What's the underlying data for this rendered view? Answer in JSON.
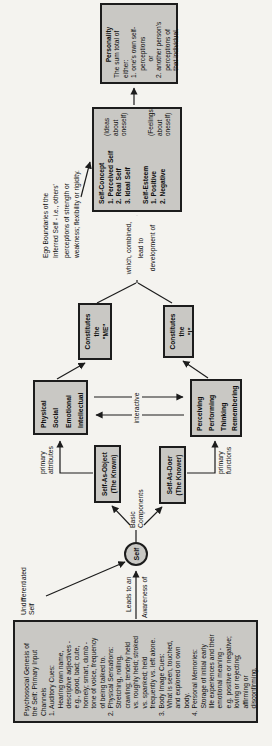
{
  "palette": {
    "page_bg": "#f4f3ef",
    "box_fill": "#c9c8c4",
    "line_color": "#1c1c1c"
  },
  "info_box": {
    "lines": [
      "Psychosocial Genesis of",
      "the Self: Primary Input",
      "Channels",
      "1. Auditory Cues:",
      "    Hearing own name,",
      "    descriptive adjectives -",
      "    e.g., good, bad; cute,",
      "    homely; smart, dumb -",
      "    tone of voice, frequency",
      "    of being talked to.",
      "2. Physical Sensations:",
      "    Stretching, rolling,",
      "    crawling; tenderly held",
      "    vs. roughly held; stroked",
      "    vs. spanked; held",
      "    frequently vs. left alone.",
      "3. Body Image Cues:",
      "    What is seen, touched,",
      "    and explored on own",
      "    body.",
      "4. Personal Memories:",
      "    Storage of initial early",
      "    life experiences and their",
      "    emotional meaning -",
      "    e.g. positive or negative;",
      "    loving or rejecting;",
      "    affirming or",
      "    disconfirming."
    ]
  },
  "undifferentiated": {
    "lines": [
      "Undifferentiated",
      "Self"
    ]
  },
  "leads_label": "Leads to an",
  "awareness_label": "Awareness of",
  "self_circle": "Self",
  "basic_components": {
    "lines": [
      "Basic",
      "Components"
    ]
  },
  "self_as_object": {
    "lines": [
      "Self-As-Object",
      "(The Known)"
    ]
  },
  "self_as_doer": {
    "lines": [
      "Self-As-Doer",
      "(The Knower)"
    ]
  },
  "primary_attributes": {
    "lines": [
      "primary",
      "attributes"
    ]
  },
  "primary_functions": {
    "lines": [
      "primary",
      "functions"
    ]
  },
  "physical_box": {
    "lines": [
      "Physical",
      "Social",
      "Emotional",
      "Intellectual"
    ]
  },
  "perceiving_box": {
    "lines": [
      "Perceiving",
      "Performing",
      "Thinking",
      "Remembering"
    ]
  },
  "interactive_label": "interactive",
  "constitutes_me": {
    "lines": [
      "Constitutes",
      "the",
      "\"ME\""
    ]
  },
  "constitutes_i": {
    "lines": [
      "Constitutes",
      "the",
      "\"I\""
    ]
  },
  "which_combined": {
    "lines": [
      "which, combined,",
      "lead to",
      "development of"
    ]
  },
  "self_concept_box": {
    "list": [
      "Self-Concept",
      "1. Perceived Self",
      "2. Real Self",
      "3. Ideal Self",
      "",
      "Self-Esteem",
      "1. Positive",
      "2. Negative"
    ],
    "ideas": [
      "(Ideas",
      "about",
      "oneself)"
    ],
    "feelings": [
      "(Feelings",
      "about",
      "oneself)"
    ]
  },
  "ego_boundaries": {
    "lines": [
      "Ego Boundaries of the",
      "Inferred Self - i.e., others'",
      "perceptions of strength or",
      "weakness; flexibility or rigidity."
    ]
  },
  "personality_box": {
    "lines": [
      "Personality",
      "The sum total of",
      "either:",
      "1. one's own self-",
      "    perceptions",
      "         or",
      "2. another person's",
      "    perceptions of",
      "    that individual."
    ]
  }
}
